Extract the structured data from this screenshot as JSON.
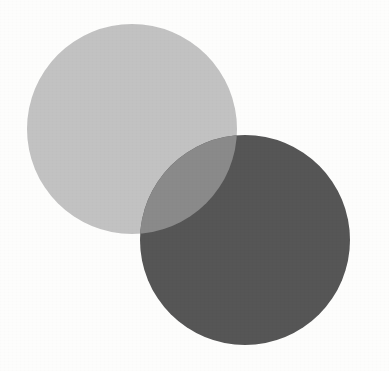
{
  "figure": {
    "type": "venn-diagram",
    "shape_count": 2,
    "caption": "",
    "background_color": "#fdfdfc",
    "canvas": {
      "width": 389,
      "height": 371
    }
  },
  "colors": {
    "background": "#fdfdfc",
    "circle_light": "#c2c2c2",
    "circle_dark": "#565656",
    "overlap": "#8a8a8a"
  },
  "shapes": [
    {
      "name": "light-gray-circle",
      "label": "",
      "cx": 132,
      "cy": 129,
      "r": 105,
      "fill": "#c2c2c2"
    },
    {
      "name": "dark-gray-circle",
      "label": "",
      "cx": 245,
      "cy": 240,
      "r": 105,
      "fill": "#565656"
    }
  ],
  "overlap_region": {
    "name": "intersection-lens",
    "label": "",
    "fill": "#8a8a8a",
    "tip_upper": {
      "x": 232,
      "y": 140
    },
    "tip_lower": {
      "x": 145,
      "y": 230
    }
  }
}
